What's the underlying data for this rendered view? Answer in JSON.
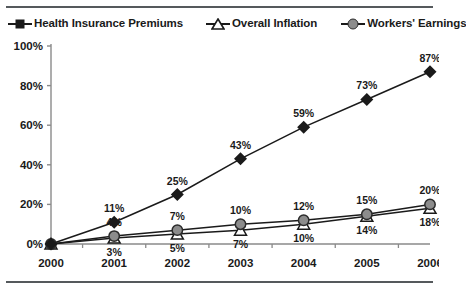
{
  "chart_data": {
    "type": "line",
    "title": "",
    "xlabel": "",
    "ylabel": "",
    "categories": [
      "2000",
      "2001",
      "2002",
      "2003",
      "2004",
      "2005",
      "2006"
    ],
    "ylim": [
      0,
      100
    ],
    "ytick_labels": [
      "0%",
      "20%",
      "40%",
      "60%",
      "80%",
      "100%"
    ],
    "ytick_values": [
      0,
      20,
      40,
      60,
      80,
      100
    ],
    "grid": false,
    "legend_position": "top",
    "series": [
      {
        "name": "Health Insurance Premiums",
        "marker": "diamond-filled",
        "color": "#1a1a1a",
        "values": [
          0,
          11,
          25,
          43,
          59,
          73,
          87
        ],
        "point_labels": [
          "",
          "11%",
          "25%",
          "43%",
          "59%",
          "73%",
          "87%"
        ],
        "label_position": "above"
      },
      {
        "name": "Overall Inflation",
        "marker": "triangle-open",
        "color": "#1a1a1a",
        "values": [
          0,
          3,
          5,
          7,
          10,
          14,
          18
        ],
        "point_labels": [
          "",
          "3%",
          "5%",
          "7%",
          "10%",
          "14%",
          "18%"
        ],
        "label_position": "below"
      },
      {
        "name": "Workers' Earnings",
        "marker": "circle-gray",
        "color": "#8c8c8c",
        "values": [
          0,
          4,
          7,
          10,
          12,
          15,
          20
        ],
        "point_labels": [
          "",
          "4%",
          "7%",
          "10%",
          "12%",
          "15%",
          "20%"
        ],
        "label_position": "above"
      }
    ]
  },
  "legend": {
    "items": [
      {
        "label": "Health Insurance Premiums",
        "icon": "diamond-marker-icon"
      },
      {
        "label": "Overall Inflation",
        "icon": "triangle-marker-icon"
      },
      {
        "label": "Workers' Earnings",
        "icon": "circle-marker-icon"
      }
    ]
  }
}
